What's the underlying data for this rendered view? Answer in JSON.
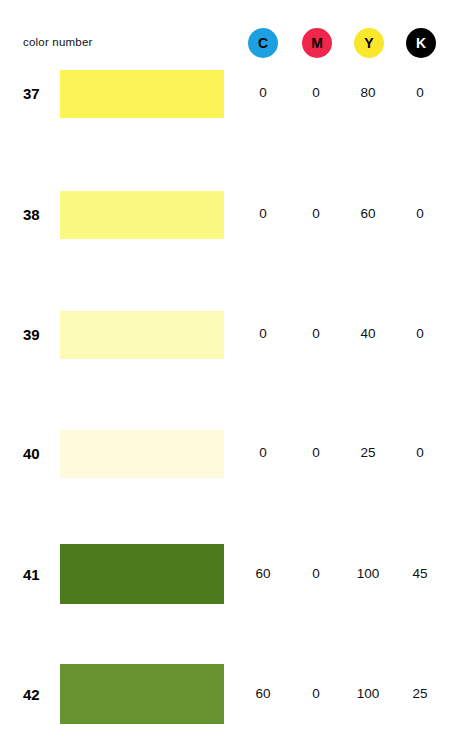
{
  "header": {
    "label": "color number",
    "inks": [
      {
        "name": "cyan",
        "letter": "C",
        "circle_color": "#1CA0E0",
        "text_color": "#000000"
      },
      {
        "name": "magenta",
        "letter": "M",
        "circle_color": "#F0274B",
        "text_color": "#000000"
      },
      {
        "name": "yellow",
        "letter": "Y",
        "circle_color": "#FAE62B",
        "text_color": "#000000"
      },
      {
        "name": "black",
        "letter": "K",
        "circle_color": "#000000",
        "text_color": "#FFFFFF"
      }
    ]
  },
  "chart_data": {
    "type": "table",
    "title": "color number",
    "columns": [
      "color number",
      "swatch",
      "C",
      "M",
      "Y",
      "K"
    ],
    "rows": [
      {
        "number": "37",
        "swatch_color": "#FAF456",
        "c": "0",
        "m": "0",
        "y": "80",
        "k": "0"
      },
      {
        "number": "38",
        "swatch_color": "#FCF983",
        "c": "0",
        "m": "0",
        "y": "60",
        "k": "0"
      },
      {
        "number": "39",
        "swatch_color": "#FCFAB7",
        "c": "0",
        "m": "0",
        "y": "40",
        "k": "0"
      },
      {
        "number": "40",
        "swatch_color": "#FDFBDC",
        "c": "0",
        "m": "0",
        "y": "25",
        "k": "0"
      },
      {
        "number": "41",
        "swatch_color": "#4E7A1E",
        "c": "60",
        "m": "0",
        "y": "100",
        "k": "45"
      },
      {
        "number": "42",
        "swatch_color": "#679230",
        "c": "60",
        "m": "0",
        "y": "100",
        "k": "25"
      }
    ]
  }
}
